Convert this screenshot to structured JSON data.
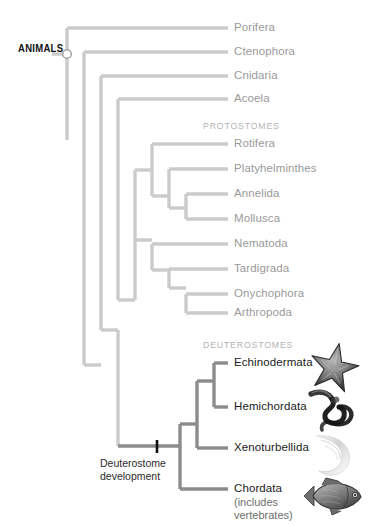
{
  "figure": {
    "type": "cladogram",
    "background_color": "#ffffff",
    "branch_color_light": "#cbcbcb",
    "branch_color_dark": "#8c8c8c",
    "label_color_light": "#9a9a9a",
    "label_color_dark": "#1b1b1b",
    "group_header_color": "#b3b3b3"
  },
  "root": {
    "label": "ANIMALS",
    "node_marker": "open-circle"
  },
  "events": [
    {
      "id": "deuterostome-development",
      "line1": "Deuterostome",
      "line2": "development",
      "marker": "tick-mark",
      "marker_color": "#111111"
    }
  ],
  "group_headers": [
    {
      "id": "protostomes",
      "label": "PROTOSTOMES"
    },
    {
      "id": "deuterostomes",
      "label": "DEUTEROSTOMES"
    }
  ],
  "taxa": [
    {
      "id": "porifera",
      "label": "Porifera",
      "group": "basal",
      "emphasis": "light"
    },
    {
      "id": "ctenophora",
      "label": "Ctenophora",
      "group": "basal",
      "emphasis": "light"
    },
    {
      "id": "cnidaria",
      "label": "Cnidaria",
      "group": "basal",
      "emphasis": "light"
    },
    {
      "id": "acoela",
      "label": "Acoela",
      "group": "basal",
      "emphasis": "light"
    },
    {
      "id": "rotifera",
      "label": "Rotifera",
      "group": "protostomes",
      "emphasis": "light"
    },
    {
      "id": "platyhelminthes",
      "label": "Platyhelminthes",
      "group": "protostomes",
      "emphasis": "light"
    },
    {
      "id": "annelida",
      "label": "Annelida",
      "group": "protostomes",
      "emphasis": "light"
    },
    {
      "id": "mollusca",
      "label": "Mollusca",
      "group": "protostomes",
      "emphasis": "light"
    },
    {
      "id": "nematoda",
      "label": "Nematoda",
      "group": "protostomes",
      "emphasis": "light"
    },
    {
      "id": "tardigrada",
      "label": "Tardigrada",
      "group": "protostomes",
      "emphasis": "light"
    },
    {
      "id": "onychophora",
      "label": "Onychophora",
      "group": "protostomes",
      "emphasis": "light"
    },
    {
      "id": "arthropoda",
      "label": "Arthropoda",
      "group": "protostomes",
      "emphasis": "light"
    },
    {
      "id": "echinodermata",
      "label": "Echinodermata",
      "group": "deuterostomes",
      "emphasis": "dark",
      "image": "starfish"
    },
    {
      "id": "hemichordata",
      "label": "Hemichordata",
      "group": "deuterostomes",
      "emphasis": "dark",
      "image": "acorn-worm"
    },
    {
      "id": "xenoturbellida",
      "label": "Xenoturbellida",
      "group": "deuterostomes",
      "emphasis": "dark",
      "image": "xenoturbella"
    },
    {
      "id": "chordata",
      "label": "Chordata",
      "group": "deuterostomes",
      "emphasis": "dark",
      "image": "fish",
      "sublabel_line1": "(includes",
      "sublabel_line2": "vertebrates)"
    }
  ]
}
